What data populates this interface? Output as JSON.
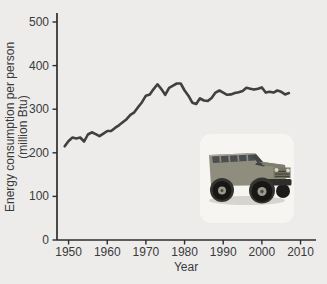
{
  "figure": {
    "background": "#edecea",
    "inset_panel_color": "#f6f5f2",
    "inset_subject": "hummer-suv-photo"
  },
  "colors": {
    "axis": "#2d2d2d",
    "text": "#3a3a3a",
    "line": "#404040"
  },
  "chart_data": {
    "type": "line",
    "title": "",
    "xlabel": "Year",
    "ylabel": "Energy consumption per person (million Btu)",
    "ylabel_line1": "Energy consumption per person",
    "ylabel_line2": "(million Btu)",
    "xlim": [
      1947,
      2014
    ],
    "ylim": [
      0,
      500
    ],
    "x_ticks": [
      1950,
      1960,
      1970,
      1980,
      1990,
      2000,
      2010
    ],
    "y_ticks": [
      0,
      100,
      200,
      300,
      400,
      500
    ],
    "grid": false,
    "legend": "none",
    "series": [
      {
        "name": "U.S. energy consumption per person",
        "x": [
          1949,
          1950,
          1951,
          1952,
          1953,
          1954,
          1955,
          1956,
          1957,
          1958,
          1959,
          1960,
          1961,
          1962,
          1963,
          1964,
          1965,
          1966,
          1967,
          1968,
          1969,
          1970,
          1971,
          1972,
          1973,
          1974,
          1975,
          1976,
          1977,
          1978,
          1979,
          1980,
          1981,
          1982,
          1983,
          1984,
          1985,
          1986,
          1987,
          1988,
          1989,
          1990,
          1991,
          1992,
          1993,
          1994,
          1995,
          1996,
          1997,
          1998,
          1999,
          2000,
          2001,
          2002,
          2003,
          2004,
          2005,
          2006,
          2007
        ],
        "values": [
          215,
          227,
          235,
          233,
          235,
          226,
          242,
          247,
          243,
          238,
          244,
          250,
          250,
          257,
          263,
          270,
          277,
          287,
          293,
          305,
          316,
          331,
          334,
          346,
          357,
          346,
          333,
          349,
          354,
          359,
          359,
          343,
          331,
          315,
          312,
          325,
          320,
          319,
          326,
          338,
          343,
          338,
          333,
          334,
          337,
          339,
          342,
          349,
          347,
          345,
          347,
          350,
          338,
          340,
          338,
          343,
          340,
          334,
          337
        ]
      }
    ]
  }
}
